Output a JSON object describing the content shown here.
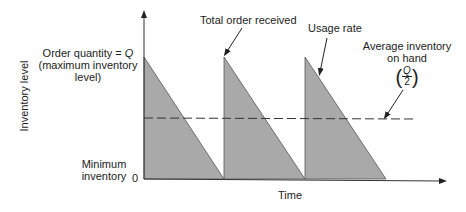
{
  "diagram": {
    "y_axis_label": "Inventory level",
    "x_axis_label": "Time",
    "max_label_line1": "Order quantity = ",
    "max_label_q": "Q",
    "max_label_line2": "(maximum inventory",
    "max_label_line3": "level)",
    "min_label_line1": "Minimum",
    "min_label_line2": "inventory",
    "zero_label": "0",
    "annotation_order": "Total order received",
    "annotation_usage": "Usage rate",
    "annotation_avg_line1": "Average inventory",
    "annotation_avg_line2": "on hand",
    "avg_fraction_num": "Q",
    "avg_fraction_den": "2",
    "colors": {
      "fill": "#a9a9a9",
      "line": "#333333"
    }
  }
}
